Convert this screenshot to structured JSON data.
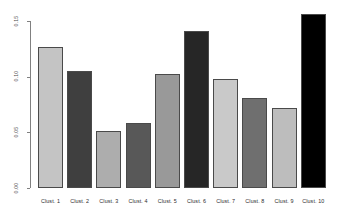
{
  "chart_data": {
    "type": "bar",
    "title": "",
    "xlabel": "",
    "ylabel": "",
    "categories": [
      "Clust. 1",
      "Clust. 2",
      "Clust. 3",
      "Clust. 4",
      "Clust. 5",
      "Clust. 6",
      "Clust. 7",
      "Clust. 8",
      "Clust. 9",
      "Clust. 10"
    ],
    "values": [
      0.127,
      0.105,
      0.051,
      0.058,
      0.102,
      0.141,
      0.098,
      0.081,
      0.072,
      0.156
    ],
    "ylim": [
      0.0,
      0.16
    ],
    "yticks": [
      0.0,
      0.05,
      0.1,
      0.15
    ],
    "ytick_labels": [
      "0.00",
      "0.05",
      "0.10",
      "0.15"
    ],
    "grid": false,
    "legend": null,
    "bar_colors": [
      "#c4c4c4",
      "#3f3f3f",
      "#adadad",
      "#585858",
      "#999999",
      "#262626",
      "#c9c9c9",
      "#6f6f6f",
      "#bdbdbd",
      "#000000"
    ],
    "axis_color": "#808080",
    "bar_border_color": "#4a4a4a"
  }
}
